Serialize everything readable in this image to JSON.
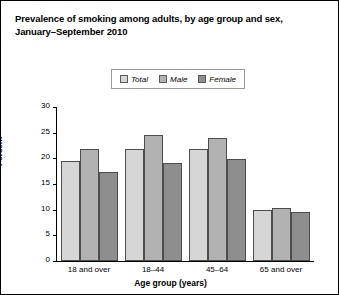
{
  "chart_data": {
    "type": "bar",
    "title": "Prevalence of smoking among adults, by age group and sex, January–September 2010",
    "title_line1": "Prevalence of smoking among adults, by age group and sex,",
    "title_line2": "January–September 2010",
    "xlabel": "Age group (years)",
    "ylabel": "Percent",
    "categories": [
      "18 and over",
      "18–44",
      "45–64",
      "65 and over"
    ],
    "series": [
      {
        "name": "Total",
        "values": [
          19.5,
          21.8,
          21.9,
          9.9
        ],
        "color": "#d6d6d6"
      },
      {
        "name": "Male",
        "values": [
          21.9,
          24.5,
          23.9,
          10.4
        ],
        "color": "#b2b2b2"
      },
      {
        "name": "Female",
        "values": [
          17.3,
          19.0,
          19.9,
          9.5
        ],
        "color": "#8e8e8e"
      }
    ],
    "ylim": [
      0,
      30
    ],
    "yticks": [
      30,
      25,
      20,
      15,
      10,
      5,
      0
    ],
    "ytick_labels": [
      "30",
      "25",
      "20",
      "15",
      "10",
      "5",
      "0"
    ],
    "grid": false,
    "legend_position": "top-center",
    "legend_entries": [
      "Total",
      "Male",
      "Female"
    ]
  }
}
